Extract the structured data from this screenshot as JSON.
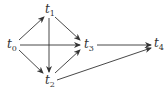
{
  "diagram": {
    "type": "directed-graph",
    "nodes": [
      {
        "id": "t0",
        "base": "t",
        "sub": "0",
        "x": 13,
        "y": 45
      },
      {
        "id": "t1",
        "base": "t",
        "sub": "1",
        "x": 49,
        "y": 10
      },
      {
        "id": "t2",
        "base": "t",
        "sub": "2",
        "x": 49,
        "y": 81
      },
      {
        "id": "t3",
        "base": "t",
        "sub": "3",
        "x": 88,
        "y": 45
      },
      {
        "id": "t4",
        "base": "t",
        "sub": "4",
        "x": 158,
        "y": 44
      }
    ],
    "edges": [
      {
        "from": "t0",
        "to": "t1"
      },
      {
        "from": "t0",
        "to": "t3"
      },
      {
        "from": "t0",
        "to": "t2"
      },
      {
        "from": "t1",
        "to": "t3"
      },
      {
        "from": "t1",
        "to": "t2"
      },
      {
        "from": "t2",
        "to": "t3"
      },
      {
        "from": "t3",
        "to": "t4"
      },
      {
        "from": "t2",
        "to": "t4"
      }
    ],
    "edge_color": "#333333"
  }
}
